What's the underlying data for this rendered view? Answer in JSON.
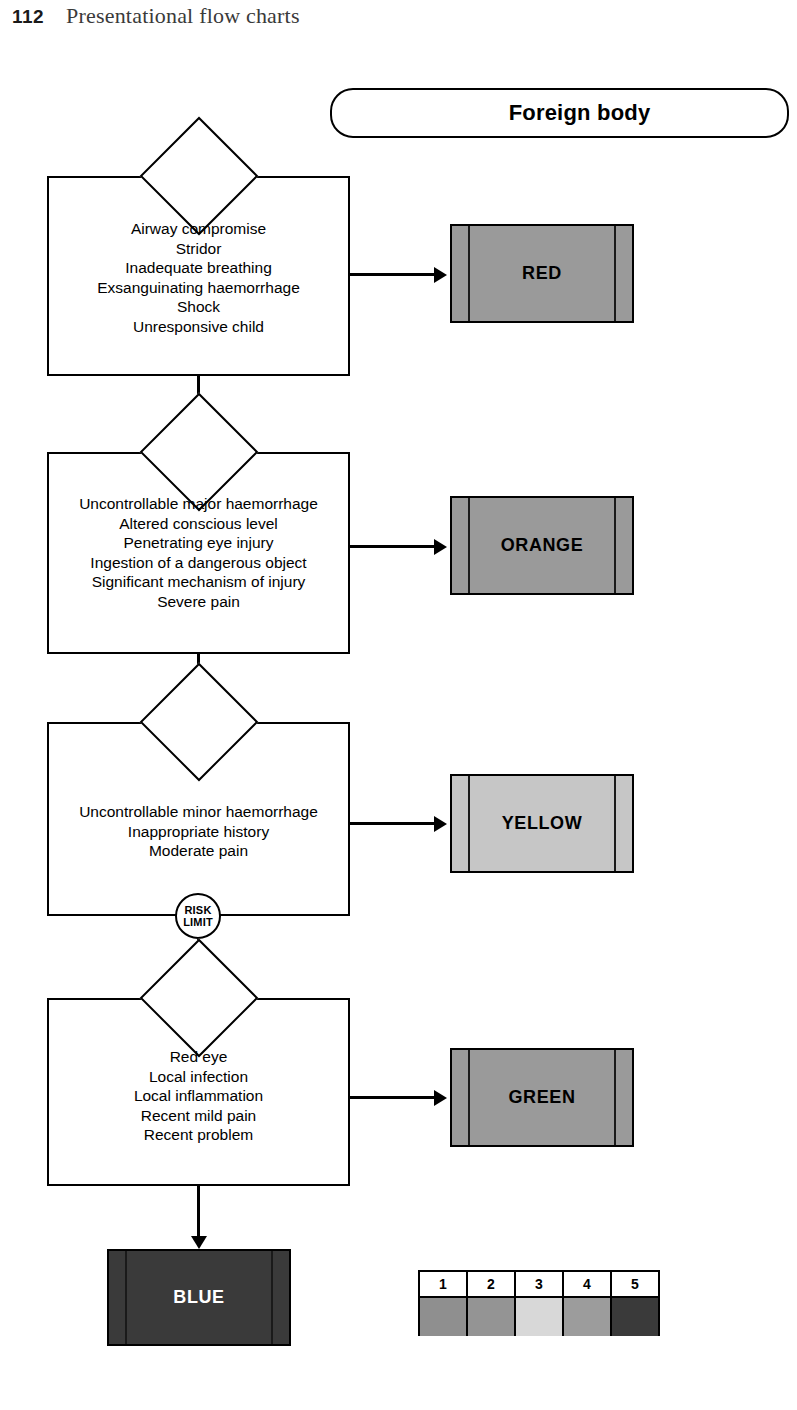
{
  "page": {
    "number": "112",
    "running_head": "Presentational flow charts"
  },
  "chart": {
    "title": "Foreign body",
    "risk_limit": {
      "line1": "RISK",
      "line2": "LIMIT"
    },
    "stages": [
      {
        "id": "red",
        "criteria": [
          "Airway compromise",
          "Stridor",
          "Inadequate breathing",
          "Exsanguinating haemorrhage",
          "Shock",
          "Unresponsive child"
        ],
        "priority_label": "RED",
        "priority_color": "#9a9a9a",
        "priority_text_color": "#000000"
      },
      {
        "id": "orange",
        "criteria": [
          "Uncontrollable major haemorrhage",
          "Altered conscious level",
          "Penetrating eye injury",
          "Ingestion of a dangerous object",
          "Significant mechanism of injury",
          "Severe pain"
        ],
        "priority_label": "ORANGE",
        "priority_color": "#9a9a9a",
        "priority_text_color": "#000000"
      },
      {
        "id": "yellow",
        "criteria": [
          "Uncontrollable minor haemorrhage",
          "Inappropriate history",
          "Moderate pain"
        ],
        "priority_label": "YELLOW",
        "priority_color": "#c6c6c6",
        "priority_text_color": "#000000"
      },
      {
        "id": "green",
        "criteria": [
          "Red eye",
          "Local infection",
          "Local inflammation",
          "Recent mild pain",
          "Recent problem"
        ],
        "priority_label": "GREEN",
        "priority_color": "#9a9a9a",
        "priority_text_color": "#000000"
      }
    ],
    "final": {
      "priority_label": "BLUE",
      "priority_color": "#3a3a3a",
      "priority_text_color": "#ffffff"
    },
    "legend": {
      "numbers": [
        "1",
        "2",
        "3",
        "4",
        "5"
      ],
      "colors": [
        "#8f8f8f",
        "#949494",
        "#d8d8d8",
        "#9c9c9c",
        "#3a3a3a"
      ]
    }
  }
}
